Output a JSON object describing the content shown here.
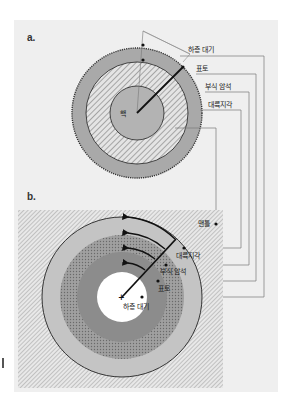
{
  "panels": [
    {
      "id": "a",
      "label": "a.",
      "core_label": "핵",
      "layers": [
        {
          "name": "하층 대기"
        },
        {
          "name": "표토"
        },
        {
          "name": "부식 암석"
        },
        {
          "name": "대륙지각"
        }
      ]
    },
    {
      "id": "b",
      "label": "b.",
      "outer_label": "맨틀",
      "layers": [
        {
          "name": "대륙지각"
        },
        {
          "name": "부식 암석"
        },
        {
          "name": "표토"
        },
        {
          "name": "하층 대기"
        }
      ]
    }
  ],
  "colors": {
    "background": "#efefef",
    "ring_gray": "#a9a9a9",
    "light_gray": "#c4c4c4",
    "dark_gray": "#8c8c8c",
    "line": "#7a7a7a",
    "arrow": "#111111"
  }
}
